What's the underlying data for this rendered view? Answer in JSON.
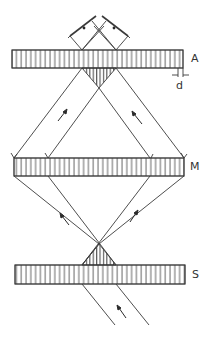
{
  "diagram": {
    "type": "interferometer-schematic",
    "stroke_color": "#3a3a3a",
    "background": "#ffffff",
    "plates": [
      {
        "id": "A",
        "label": "A",
        "x": 12,
        "y": 50,
        "w": 171,
        "h": 18
      },
      {
        "id": "M",
        "label": "M",
        "x": 14,
        "y": 158,
        "w": 170,
        "h": 18
      },
      {
        "id": "S",
        "label": "S",
        "x": 15,
        "y": 265,
        "w": 170,
        "h": 19
      }
    ],
    "dimension_label": "d",
    "labels": {
      "plate_a": "A",
      "plate_m": "M",
      "plate_s": "S",
      "spacing": "d"
    }
  }
}
